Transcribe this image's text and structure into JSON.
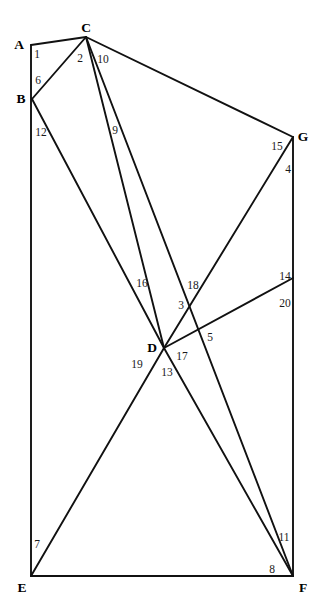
{
  "figure": {
    "background_color": "#ffffff",
    "line_color": "#111111",
    "label_color": "#000000",
    "width": 321,
    "height": 612,
    "vertices": [
      {
        "id": "A",
        "label": "A",
        "x": 19,
        "y": 45,
        "lx": 19,
        "ly": 45
      },
      {
        "id": "B",
        "label": "B",
        "x": 21,
        "y": 99,
        "lx": 21,
        "ly": 99
      },
      {
        "id": "C",
        "label": "C",
        "x": 86,
        "y": 28,
        "lx": 86,
        "ly": 28
      },
      {
        "id": "G",
        "label": "G",
        "x": 303,
        "y": 137,
        "lx": 303,
        "ly": 137
      },
      {
        "id": "D",
        "label": "D",
        "x": 152,
        "y": 348,
        "lx": 152,
        "ly": 348
      },
      {
        "id": "E",
        "label": "E",
        "x": 22,
        "y": 588,
        "lx": 22,
        "ly": 588
      },
      {
        "id": "F",
        "label": "F",
        "x": 303,
        "y": 588,
        "lx": 303,
        "ly": 588
      }
    ],
    "points": {
      "A": {
        "x": 31,
        "y": 45
      },
      "B": {
        "x": 32,
        "y": 99
      },
      "C": {
        "x": 86,
        "y": 37
      },
      "G": {
        "x": 293,
        "y": 137
      },
      "D": {
        "x": 164,
        "y": 348
      },
      "E": {
        "x": 31,
        "y": 576
      },
      "F": {
        "x": 293,
        "y": 576
      },
      "P3": {
        "x": 191,
        "y": 312
      },
      "R14": {
        "x": 293,
        "y": 278
      }
    },
    "segments": [
      {
        "id": "AC",
        "from": "A",
        "to": "C"
      },
      {
        "id": "AE",
        "from": "A",
        "to": "E"
      },
      {
        "id": "BC",
        "from": "B",
        "to": "C"
      },
      {
        "id": "BD",
        "from": "B",
        "to": "D"
      },
      {
        "id": "CD",
        "from": "C",
        "to": "D"
      },
      {
        "id": "CF",
        "from": "C",
        "to": "F"
      },
      {
        "id": "CG",
        "from": "C",
        "to": "G"
      },
      {
        "id": "GF",
        "from": "G",
        "to": "F"
      },
      {
        "id": "GD",
        "from": "G",
        "to": "D"
      },
      {
        "id": "DE",
        "from": "D",
        "to": "E"
      },
      {
        "id": "DF",
        "from": "D",
        "to": "F"
      },
      {
        "id": "DR",
        "from": "D",
        "to": "R14"
      },
      {
        "id": "EF",
        "from": "E",
        "to": "F"
      }
    ],
    "angle_labels": [
      {
        "id": "1",
        "text": "1",
        "x": 37,
        "y": 55,
        "at": "A"
      },
      {
        "id": "6",
        "text": "6",
        "x": 38,
        "y": 81,
        "at": "A"
      },
      {
        "id": "12",
        "text": "12",
        "x": 41,
        "y": 133,
        "at": "B"
      },
      {
        "id": "2",
        "text": "2",
        "x": 80,
        "y": 59,
        "at": "C"
      },
      {
        "id": "10",
        "text": "10",
        "x": 103,
        "y": 60,
        "at": "C"
      },
      {
        "id": "9",
        "text": "9",
        "x": 115,
        "y": 131,
        "at": "C"
      },
      {
        "id": "15",
        "text": "15",
        "x": 277,
        "y": 147,
        "at": "G"
      },
      {
        "id": "4",
        "text": "4",
        "x": 288,
        "y": 170,
        "at": "G"
      },
      {
        "id": "16",
        "text": "16",
        "x": 142,
        "y": 284,
        "at": "D"
      },
      {
        "id": "18",
        "text": "18",
        "x": 193,
        "y": 286,
        "at": "D"
      },
      {
        "id": "3",
        "text": "3",
        "x": 181,
        "y": 306,
        "at": "P3"
      },
      {
        "id": "14",
        "text": "14",
        "x": 285,
        "y": 277,
        "at": "R14"
      },
      {
        "id": "20",
        "text": "20",
        "x": 285,
        "y": 304,
        "at": "R14"
      },
      {
        "id": "5",
        "text": "5",
        "x": 210,
        "y": 338,
        "at": "D"
      },
      {
        "id": "17",
        "text": "17",
        "x": 182,
        "y": 357,
        "at": "D"
      },
      {
        "id": "19",
        "text": "19",
        "x": 137,
        "y": 365,
        "at": "D"
      },
      {
        "id": "13",
        "text": "13",
        "x": 167,
        "y": 373,
        "at": "D"
      },
      {
        "id": "7",
        "text": "7",
        "x": 37,
        "y": 545,
        "at": "E"
      },
      {
        "id": "11",
        "text": "11",
        "x": 284,
        "y": 538,
        "at": "F"
      },
      {
        "id": "8",
        "text": "8",
        "x": 272,
        "y": 570,
        "at": "F"
      }
    ]
  }
}
